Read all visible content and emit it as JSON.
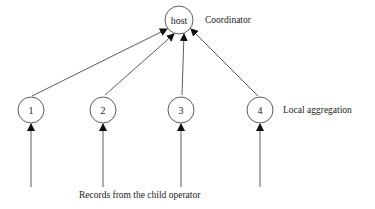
{
  "diagram": {
    "host": {
      "label": "host",
      "caption": "Coordinator"
    },
    "nodes": [
      {
        "label": "1"
      },
      {
        "label": "2"
      },
      {
        "label": "3"
      },
      {
        "label": "4"
      }
    ],
    "local_caption": "Local aggregation",
    "input_caption": "Records from the child operator",
    "colors": {
      "stroke": "#333333",
      "text": "#222222"
    }
  }
}
